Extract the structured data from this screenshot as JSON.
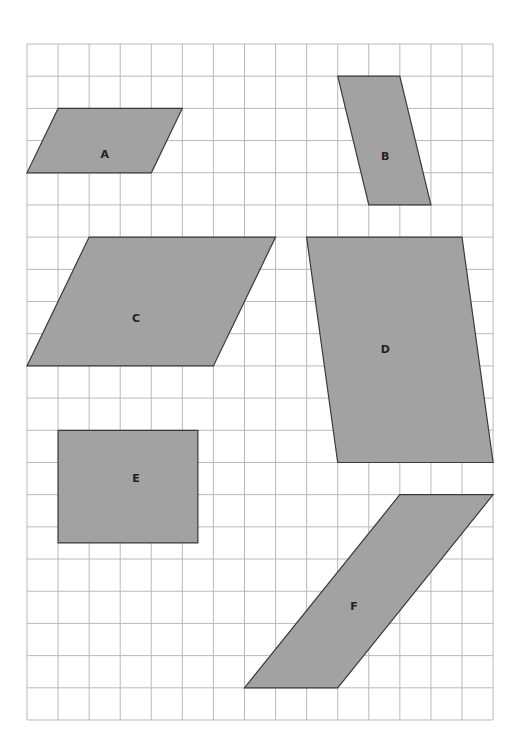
{
  "grid": {
    "origin_x": 27,
    "origin_y": 44,
    "columns": 15,
    "rows": 21,
    "cell_width": 31.07,
    "cell_height": 32.19,
    "line_color": "#b9b9b9"
  },
  "colors": {
    "shape_fill": "#a2a2a2",
    "shape_stroke": "#3a3a3a",
    "label": "#222222"
  },
  "shapes": [
    {
      "label": "A",
      "type": "parallelogram",
      "vertices_grid": [
        [
          1,
          2
        ],
        [
          5,
          2
        ],
        [
          4,
          4
        ],
        [
          0,
          4
        ]
      ],
      "label_grid": [
        2.5,
        3.45
      ]
    },
    {
      "label": "B",
      "type": "parallelogram",
      "vertices_grid": [
        [
          10,
          1
        ],
        [
          12,
          1
        ],
        [
          13,
          5
        ],
        [
          11,
          5
        ]
      ],
      "label_grid": [
        11.53,
        3.51
      ]
    },
    {
      "label": "C",
      "type": "parallelogram",
      "vertices_grid": [
        [
          2,
          6
        ],
        [
          8,
          6
        ],
        [
          6,
          10
        ],
        [
          0,
          10
        ]
      ],
      "label_grid": [
        3.51,
        8.54
      ]
    },
    {
      "label": "D",
      "type": "parallelogram",
      "vertices_grid": [
        [
          9,
          6
        ],
        [
          14,
          6
        ],
        [
          15,
          13
        ],
        [
          10,
          13
        ]
      ],
      "label_grid": [
        11.53,
        9.5
      ]
    },
    {
      "label": "E",
      "type": "rectangle",
      "vertices_grid": [
        [
          1,
          12
        ],
        [
          5.5,
          12
        ],
        [
          5.5,
          15.5
        ],
        [
          1,
          15.5
        ]
      ],
      "label_grid": [
        3.51,
        13.51
      ]
    },
    {
      "label": "F",
      "type": "parallelogram",
      "vertices_grid": [
        [
          12,
          14
        ],
        [
          15,
          14
        ],
        [
          10,
          20
        ],
        [
          7,
          20
        ]
      ],
      "label_grid": [
        10.52,
        17.49
      ]
    }
  ]
}
